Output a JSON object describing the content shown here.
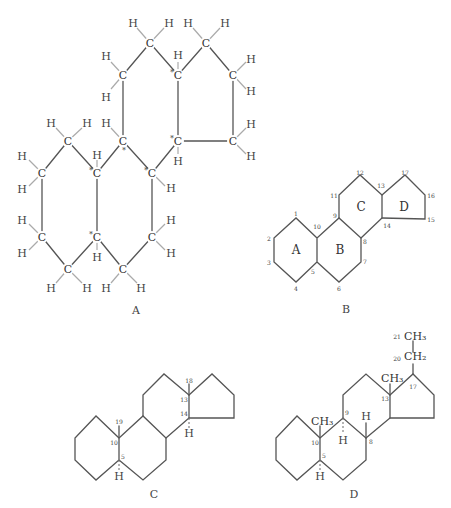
{
  "figure": {
    "panels": [
      {
        "id": "A",
        "caption": "A",
        "description": "Full structural formula of the steroid nucleus with all C and H atoms; starred carbons mark chiral centers"
      },
      {
        "id": "B",
        "caption": "B",
        "description": "Skeletal numbering of steroid nucleus with rings A, B, C, D",
        "ring_labels": [
          "A",
          "B",
          "C",
          "D"
        ],
        "atom_numbers": [
          "1",
          "2",
          "3",
          "4",
          "5",
          "6",
          "7",
          "8",
          "9",
          "10",
          "11",
          "12",
          "13",
          "14",
          "15",
          "16",
          "17"
        ]
      },
      {
        "id": "C",
        "caption": "C",
        "description": "Steroid skeleton with stereochemistry",
        "numbers": [
          "19",
          "10",
          "5",
          "18",
          "13",
          "14"
        ],
        "h_labels": [
          "H",
          "H"
        ]
      },
      {
        "id": "D",
        "caption": "D",
        "description": "Substituted steroid skeleton with methyl and ethyl groups",
        "numbers": [
          "10",
          "5",
          "9",
          "8",
          "13",
          "17",
          "20",
          "21"
        ],
        "groups": [
          "CH3",
          "CH3",
          "CH2",
          "CH3"
        ],
        "h_labels": [
          "H",
          "H",
          "H"
        ]
      }
    ],
    "atom_symbols": {
      "carbon": "C",
      "hydrogen": "H",
      "chiral_marker": "*"
    },
    "group_text": {
      "ch3": "CH₃",
      "ch2": "CH₂"
    }
  }
}
